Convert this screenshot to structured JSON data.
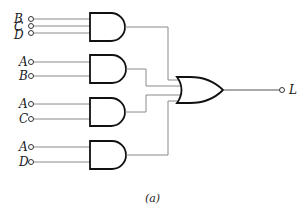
{
  "diagram": {
    "type": "logic-circuit",
    "caption": "(a)",
    "output": {
      "label": "L"
    },
    "and_gates": [
      {
        "id": "and1",
        "inputs": [
          "B",
          "C",
          "D"
        ]
      },
      {
        "id": "and2",
        "inputs": [
          "A",
          "B"
        ]
      },
      {
        "id": "and3",
        "inputs": [
          "A",
          "C"
        ]
      },
      {
        "id": "and4",
        "inputs": [
          "A",
          "D"
        ]
      }
    ],
    "or_gate": {
      "id": "or1",
      "inputs": [
        "and1",
        "and2",
        "and3",
        "and4"
      ],
      "output": "L"
    },
    "labels": {
      "g1_in1": "B",
      "g1_in2": "C",
      "g1_in3": "D",
      "g2_in1": "A",
      "g2_in2": "B",
      "g3_in1": "A",
      "g3_in2": "C",
      "g4_in1": "A",
      "g4_in2": "D"
    },
    "colors": {
      "wire": "#8a8a8a",
      "gate_outline": "#111111",
      "text": "#1a1a1a"
    }
  }
}
